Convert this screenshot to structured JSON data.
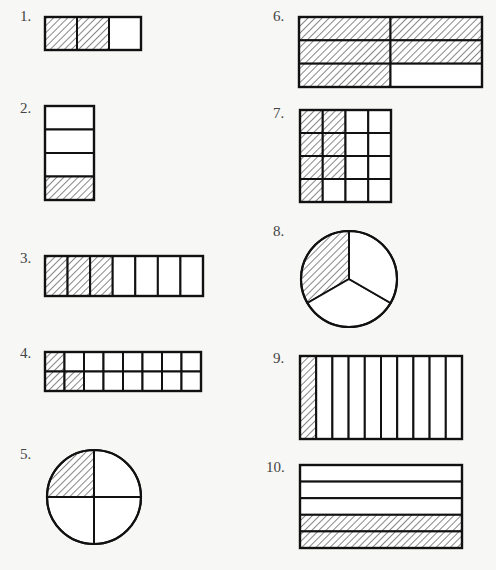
{
  "colors": {
    "stroke": "#111111",
    "hatch": "#222222",
    "fill": "#ffffff",
    "background": "#f7f7f5",
    "label": "#444444"
  },
  "figures": [
    {
      "number": "1.",
      "type": "grid",
      "label_pos": [
        20,
        8
      ],
      "box": [
        45,
        17,
        96,
        33
      ],
      "rows": 1,
      "cols": 3,
      "shaded": [
        [
          0,
          0
        ],
        [
          0,
          1
        ]
      ],
      "shaded_count": 2,
      "total_parts": 3
    },
    {
      "number": "2.",
      "type": "grid",
      "label_pos": [
        20,
        100
      ],
      "box": [
        45,
        106,
        49,
        94
      ],
      "rows": 4,
      "cols": 1,
      "shaded": [
        [
          3,
          0
        ]
      ],
      "shaded_count": 1,
      "total_parts": 4
    },
    {
      "number": "3.",
      "type": "grid",
      "label_pos": [
        20,
        250
      ],
      "box": [
        45,
        256,
        158,
        40
      ],
      "rows": 1,
      "cols": 7,
      "shaded": [
        [
          0,
          0
        ],
        [
          0,
          1
        ],
        [
          0,
          2
        ]
      ],
      "shaded_count": 3,
      "total_parts": 7
    },
    {
      "number": "4.",
      "type": "grid",
      "label_pos": [
        20,
        345
      ],
      "box": [
        45,
        352,
        156,
        39
      ],
      "rows": 2,
      "cols": 8,
      "shaded": [
        [
          0,
          0
        ],
        [
          1,
          0
        ],
        [
          1,
          1
        ]
      ],
      "shaded_count": 3,
      "total_parts": 16
    },
    {
      "number": "5.",
      "type": "circle",
      "label_pos": [
        20,
        446
      ],
      "center": [
        94,
        497
      ],
      "radius": 47,
      "parts": 4,
      "shaded_sectors": [
        0
      ],
      "shaded_count": 1,
      "total_parts": 4
    },
    {
      "number": "6.",
      "type": "grid",
      "label_pos": [
        273,
        8
      ],
      "box": [
        299,
        17,
        183,
        70
      ],
      "rows": 3,
      "cols": 2,
      "shaded": [
        [
          0,
          0
        ],
        [
          0,
          1
        ],
        [
          1,
          0
        ],
        [
          1,
          1
        ],
        [
          2,
          0
        ]
      ],
      "shaded_count": 5,
      "total_parts": 6
    },
    {
      "number": "7.",
      "type": "grid",
      "label_pos": [
        273,
        105
      ],
      "box": [
        300,
        110,
        91,
        92
      ],
      "rows": 4,
      "cols": 4,
      "shaded": [
        [
          0,
          0
        ],
        [
          1,
          0
        ],
        [
          2,
          0
        ],
        [
          3,
          0
        ],
        [
          0,
          1
        ],
        [
          1,
          1
        ],
        [
          2,
          1
        ]
      ],
      "shaded_count": 7,
      "total_parts": 16
    },
    {
      "number": "8.",
      "type": "circle",
      "label_pos": [
        273,
        223
      ],
      "center": [
        349,
        279
      ],
      "radius": 48,
      "parts": 3,
      "shaded_sectors": [
        0
      ],
      "shaded_count": 1,
      "total_parts": 3
    },
    {
      "number": "9.",
      "type": "grid",
      "label_pos": [
        273,
        350
      ],
      "box": [
        300,
        356,
        162,
        83
      ],
      "rows": 1,
      "cols": 10,
      "shaded": [
        [
          0,
          0
        ]
      ],
      "shaded_count": 1,
      "total_parts": 10
    },
    {
      "number": "10.",
      "type": "grid",
      "label_pos": [
        266,
        459
      ],
      "box": [
        300,
        465,
        162,
        83
      ],
      "rows": 5,
      "cols": 1,
      "shaded": [
        [
          3,
          0
        ],
        [
          4,
          0
        ]
      ],
      "shaded_count": 2,
      "total_parts": 5
    }
  ]
}
